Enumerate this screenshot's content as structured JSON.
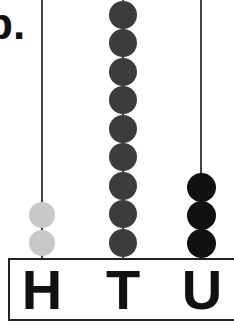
{
  "question_label": "b.",
  "abacus": {
    "columns": [
      {
        "label": "H",
        "name": "hundreds",
        "beads": 2,
        "bead_color": "#c8c8c8"
      },
      {
        "label": "T",
        "name": "tens",
        "beads": 9,
        "bead_color": "#3c3c3c"
      },
      {
        "label": "U",
        "name": "units",
        "beads": 3,
        "bead_color": "#111111"
      }
    ]
  }
}
